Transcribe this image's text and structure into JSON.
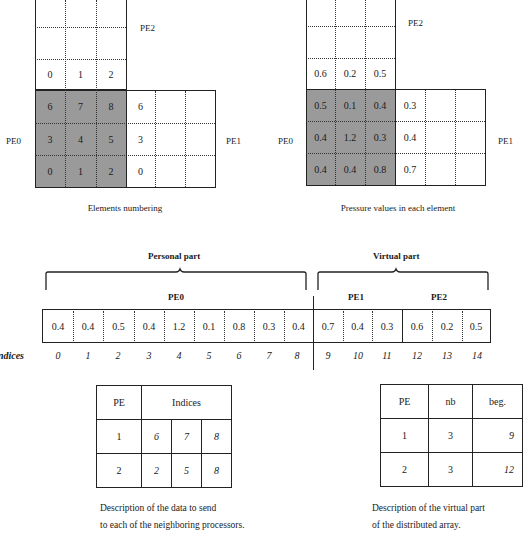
{
  "left_mesh": {
    "caption": "Elements numbering",
    "labels": {
      "top": "PE2",
      "left": "PE0",
      "right": "PE1"
    },
    "pe2_row": [
      "0",
      "1",
      "2"
    ],
    "pe0_rows": [
      [
        "6",
        "7",
        "8"
      ],
      [
        "3",
        "4",
        "5"
      ],
      [
        "0",
        "1",
        "2"
      ]
    ],
    "pe1_col": [
      "6",
      "3",
      "0"
    ]
  },
  "right_mesh": {
    "caption": "Pressure values in each element",
    "labels": {
      "top": "PE2",
      "left": "PE0",
      "right": "PE1"
    },
    "pe2_row": [
      "0.6",
      "0.2",
      "0.5"
    ],
    "pe0_rows": [
      [
        "0.5",
        "0.1",
        "0.4"
      ],
      [
        "0.4",
        "1.2",
        "0.3"
      ],
      [
        "0.4",
        "0.4",
        "0.8"
      ]
    ],
    "pe1_col": [
      "0.3",
      "0.4",
      "0.7"
    ]
  },
  "array": {
    "personal_label": "Personal part",
    "virtual_label": "Virtual part",
    "pe0_label": "PE0",
    "pe1_label": "PE1",
    "pe2_label": "PE2",
    "indices_label": "Indices",
    "values": [
      "0.4",
      "0.4",
      "0.5",
      "0.4",
      "1.2",
      "0.1",
      "0.8",
      "0.3",
      "0.4",
      "0.7",
      "0.4",
      "0.3",
      "0.6",
      "0.2",
      "0.5"
    ],
    "indices": [
      "0",
      "1",
      "2",
      "3",
      "4",
      "5",
      "6",
      "7",
      "8",
      "9",
      "10",
      "11",
      "12",
      "13",
      "14"
    ]
  },
  "send_table": {
    "headers": [
      "PE",
      "Indices"
    ],
    "rows": [
      {
        "pe": "1",
        "indices": [
          "6",
          "7",
          "8"
        ]
      },
      {
        "pe": "2",
        "indices": [
          "2",
          "5",
          "8"
        ]
      }
    ],
    "caption_line1": "Description of the data to send",
    "caption_line2": "to each of the neighboring processors."
  },
  "virtual_table": {
    "headers": [
      "PE",
      "nb",
      "beg."
    ],
    "rows": [
      {
        "pe": "1",
        "nb": "3",
        "beg": "9"
      },
      {
        "pe": "2",
        "nb": "3",
        "beg": "12"
      }
    ],
    "caption_line1": "Description of the virtual part",
    "caption_line2": "of the distributed array."
  },
  "colors": {
    "shade": "#9a9a9a",
    "line": "#222222",
    "background": "#ffffff"
  }
}
